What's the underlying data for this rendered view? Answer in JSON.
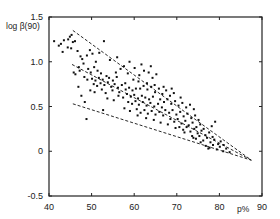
{
  "chart_data": {
    "type": "scatter",
    "title": "",
    "xlabel": "p%",
    "ylabel": "log β(90)",
    "xlim": [
      40,
      90
    ],
    "ylim": [
      -0.5,
      1.5
    ],
    "x_ticks": [
      40,
      50,
      60,
      70,
      80,
      90
    ],
    "x_tick_labels": [
      "40",
      "50",
      "60",
      "70",
      "80",
      "90"
    ],
    "y_ticks": [
      -0.5,
      0,
      0.5,
      1.0,
      1.5
    ],
    "y_tick_labels": [
      "-0.5",
      "0",
      "0.5",
      "1.0",
      "1.5"
    ],
    "grid": false,
    "legend": null,
    "colors": {
      "points": "#111111",
      "lines": "#111111",
      "axes": "#222222",
      "background": "#ffffff"
    },
    "reference_lines": [
      {
        "name": "upper-bound",
        "style": "dashed",
        "x": [
          45.6,
          87.5
        ],
        "y": [
          1.35,
          -0.1
        ]
      },
      {
        "name": "center-trend",
        "style": "dashed",
        "x": [
          45.4,
          87.5
        ],
        "y": [
          0.97,
          -0.1
        ]
      },
      {
        "name": "lower-bound",
        "style": "dashed",
        "x": [
          45.6,
          87.5
        ],
        "y": [
          0.53,
          -0.1
        ]
      }
    ],
    "series": [
      {
        "name": "observations",
        "points": [
          [
            41.2,
            1.23
          ],
          [
            42.3,
            1.18
          ],
          [
            42.8,
            1.2
          ],
          [
            43.5,
            1.24
          ],
          [
            43.2,
            1.11
          ],
          [
            44.5,
            1.25
          ],
          [
            44.9,
            1.28
          ],
          [
            45.3,
            1.3
          ],
          [
            45.6,
            1.22
          ],
          [
            46.1,
            1.23
          ],
          [
            45.2,
            1.15
          ],
          [
            46.7,
            1.12
          ],
          [
            44.4,
            1.16
          ],
          [
            47.4,
            1.06
          ],
          [
            47.8,
            1.03
          ],
          [
            48.9,
            1.07
          ],
          [
            49.6,
            1.13
          ],
          [
            50.2,
            1.09
          ],
          [
            51.8,
            1.1
          ],
          [
            52.9,
            1.23
          ],
          [
            47.2,
            0.9
          ],
          [
            46.2,
            0.86
          ],
          [
            45.8,
            0.88
          ],
          [
            47.0,
            0.94
          ],
          [
            48.1,
            0.98
          ],
          [
            49.2,
            0.92
          ],
          [
            49.8,
            0.88
          ],
          [
            50.6,
            0.94
          ],
          [
            51.4,
            0.9
          ],
          [
            52.2,
            0.87
          ],
          [
            48.3,
            0.83
          ],
          [
            49.0,
            0.8
          ],
          [
            50.1,
            0.81
          ],
          [
            50.9,
            0.79
          ],
          [
            51.7,
            0.82
          ],
          [
            52.6,
            0.8
          ],
          [
            53.5,
            0.84
          ],
          [
            54.1,
            0.82
          ],
          [
            55.0,
            0.79
          ],
          [
            55.9,
            0.83
          ],
          [
            50.5,
            0.75
          ],
          [
            51.3,
            0.73
          ],
          [
            52.1,
            0.76
          ],
          [
            53.0,
            0.74
          ],
          [
            53.8,
            0.77
          ],
          [
            54.6,
            0.72
          ],
          [
            55.4,
            0.75
          ],
          [
            56.2,
            0.71
          ],
          [
            57.1,
            0.74
          ],
          [
            57.9,
            0.76
          ],
          [
            49.7,
            0.68
          ],
          [
            50.7,
            0.66
          ],
          [
            52.4,
            0.69
          ],
          [
            53.3,
            0.65
          ],
          [
            54.9,
            0.68
          ],
          [
            56.5,
            0.66
          ],
          [
            58.0,
            0.69
          ],
          [
            58.8,
            0.71
          ],
          [
            59.6,
            0.68
          ],
          [
            60.4,
            0.7
          ],
          [
            55.7,
            0.88
          ],
          [
            56.8,
            0.92
          ],
          [
            57.6,
            0.95
          ],
          [
            58.5,
            0.87
          ],
          [
            60.1,
            0.93
          ],
          [
            61.2,
            0.85
          ],
          [
            62.3,
            0.9
          ],
          [
            63.4,
            0.88
          ],
          [
            64.3,
            0.82
          ],
          [
            65.2,
            0.86
          ],
          [
            56.3,
            0.62
          ],
          [
            57.4,
            0.6
          ],
          [
            58.3,
            0.64
          ],
          [
            59.2,
            0.61
          ],
          [
            60.0,
            0.63
          ],
          [
            60.9,
            0.59
          ],
          [
            61.8,
            0.62
          ],
          [
            62.6,
            0.6
          ],
          [
            63.5,
            0.58
          ],
          [
            64.4,
            0.61
          ],
          [
            58.6,
            0.55
          ],
          [
            59.5,
            0.53
          ],
          [
            60.3,
            0.56
          ],
          [
            61.1,
            0.52
          ],
          [
            62.0,
            0.55
          ],
          [
            62.9,
            0.51
          ],
          [
            63.8,
            0.54
          ],
          [
            64.7,
            0.5
          ],
          [
            65.6,
            0.53
          ],
          [
            66.5,
            0.49
          ],
          [
            57.7,
            0.48
          ],
          [
            59.0,
            0.45
          ],
          [
            60.6,
            0.47
          ],
          [
            61.5,
            0.43
          ],
          [
            62.4,
            0.46
          ],
          [
            63.2,
            0.42
          ],
          [
            64.1,
            0.45
          ],
          [
            65.0,
            0.41
          ],
          [
            65.9,
            0.44
          ],
          [
            66.8,
            0.4
          ],
          [
            61.4,
            0.7
          ],
          [
            62.2,
            0.73
          ],
          [
            63.1,
            0.69
          ],
          [
            64.0,
            0.72
          ],
          [
            64.9,
            0.66
          ],
          [
            65.8,
            0.7
          ],
          [
            66.6,
            0.64
          ],
          [
            67.5,
            0.68
          ],
          [
            68.4,
            0.62
          ],
          [
            69.3,
            0.65
          ],
          [
            66.1,
            0.58
          ],
          [
            67.0,
            0.55
          ],
          [
            67.8,
            0.58
          ],
          [
            68.7,
            0.53
          ],
          [
            69.6,
            0.56
          ],
          [
            70.4,
            0.51
          ],
          [
            71.3,
            0.54
          ],
          [
            72.2,
            0.49
          ],
          [
            73.1,
            0.52
          ],
          [
            74.0,
            0.47
          ],
          [
            67.3,
            0.46
          ],
          [
            68.2,
            0.43
          ],
          [
            69.0,
            0.46
          ],
          [
            69.9,
            0.41
          ],
          [
            70.8,
            0.44
          ],
          [
            71.6,
            0.39
          ],
          [
            72.5,
            0.42
          ],
          [
            73.4,
            0.37
          ],
          [
            74.3,
            0.4
          ],
          [
            75.1,
            0.35
          ],
          [
            68.5,
            0.36
          ],
          [
            69.4,
            0.33
          ],
          [
            70.2,
            0.36
          ],
          [
            71.1,
            0.31
          ],
          [
            72.0,
            0.34
          ],
          [
            72.8,
            0.29
          ],
          [
            73.7,
            0.32
          ],
          [
            74.6,
            0.27
          ],
          [
            75.5,
            0.3
          ],
          [
            76.3,
            0.25
          ],
          [
            70.6,
            0.27
          ],
          [
            71.5,
            0.24
          ],
          [
            72.3,
            0.27
          ],
          [
            73.2,
            0.22
          ],
          [
            74.1,
            0.25
          ],
          [
            74.9,
            0.2
          ],
          [
            75.8,
            0.23
          ],
          [
            76.7,
            0.18
          ],
          [
            77.6,
            0.21
          ],
          [
            78.4,
            0.16
          ],
          [
            73.6,
            0.17
          ],
          [
            74.5,
            0.14
          ],
          [
            75.3,
            0.17
          ],
          [
            76.2,
            0.12
          ],
          [
            77.1,
            0.15
          ],
          [
            77.9,
            0.1
          ],
          [
            78.8,
            0.13
          ],
          [
            79.7,
            0.08
          ],
          [
            80.3,
            0.11
          ],
          [
            81.0,
            0.07
          ],
          [
            76.8,
            0.06
          ],
          [
            77.7,
            0.04
          ],
          [
            78.5,
            0.07
          ],
          [
            79.4,
            0.02
          ],
          [
            80.1,
            0.05
          ],
          [
            80.9,
            0.0
          ],
          [
            81.6,
            0.03
          ],
          [
            82.4,
            -0.01
          ],
          [
            79.0,
            0.33
          ],
          [
            78.2,
            0.28
          ],
          [
            47.6,
            0.62
          ],
          [
            48.4,
            0.55
          ],
          [
            46.9,
            0.72
          ],
          [
            54.3,
            1.02
          ],
          [
            56.0,
            1.05
          ],
          [
            58.9,
            1.0
          ],
          [
            61.7,
            0.97
          ],
          [
            63.9,
            0.95
          ],
          [
            53.7,
            0.59
          ],
          [
            55.2,
            0.57
          ],
          [
            60.8,
            0.4
          ],
          [
            62.8,
            0.37
          ],
          [
            64.6,
            0.35
          ],
          [
            66.2,
            0.32
          ],
          [
            67.9,
            0.3
          ],
          [
            69.7,
            0.26
          ],
          [
            71.8,
            0.21
          ],
          [
            73.9,
            0.15
          ],
          [
            75.6,
            0.1
          ],
          [
            77.4,
            0.03
          ],
          [
            48.8,
            0.36
          ],
          [
            52.7,
            0.46
          ],
          [
            51.0,
            1.0
          ],
          [
            59.8,
            0.8
          ],
          [
            61.0,
            0.78
          ],
          [
            63.0,
            0.76
          ],
          [
            64.8,
            0.74
          ],
          [
            66.9,
            0.72
          ],
          [
            68.8,
            0.7
          ],
          [
            70.9,
            0.6
          ]
        ]
      }
    ]
  }
}
